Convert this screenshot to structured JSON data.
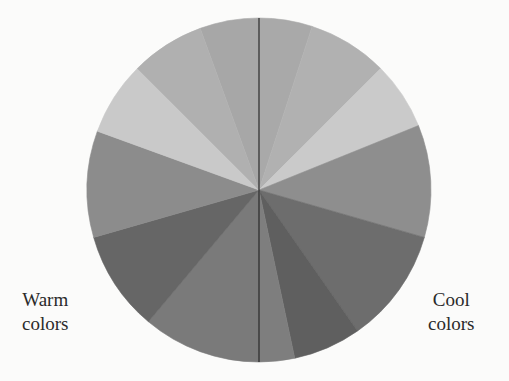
{
  "figure": {
    "type": "color-wheel",
    "center": [
      259,
      190
    ],
    "radius": 172,
    "divider": {
      "x": 259,
      "color": "#2b2b2b",
      "width": 1.2
    },
    "wedges": [
      {
        "start": -20,
        "end": 0,
        "color": "#a7a7a7"
      },
      {
        "start": 0,
        "end": 18,
        "color": "#a9a9a9"
      },
      {
        "start": 18,
        "end": 45,
        "color": "#b1b1b1"
      },
      {
        "start": 45,
        "end": 68,
        "color": "#cacaca"
      },
      {
        "start": 68,
        "end": 106,
        "color": "#8e8e8e"
      },
      {
        "start": 106,
        "end": 145,
        "color": "#6d6d6d"
      },
      {
        "start": 145,
        "end": 168,
        "color": "#5f5f5f"
      },
      {
        "start": 168,
        "end": 180,
        "color": "#7e7e7e"
      },
      {
        "start": 180,
        "end": 220,
        "color": "#7a7a7a"
      },
      {
        "start": 220,
        "end": 254,
        "color": "#666666"
      },
      {
        "start": 254,
        "end": 290,
        "color": "#8c8c8c"
      },
      {
        "start": 290,
        "end": 315,
        "color": "#c9c9c9"
      },
      {
        "start": 315,
        "end": 340,
        "color": "#b0b0b0"
      }
    ]
  },
  "labels": {
    "warm": {
      "line1": "Warm",
      "line2": "colors"
    },
    "cool": {
      "line1": "Cool",
      "line2": "colors"
    }
  }
}
